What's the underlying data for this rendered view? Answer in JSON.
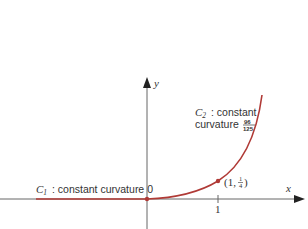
{
  "diagram": {
    "axes": {
      "x_label": "x",
      "y_label": "y",
      "x_tick_label": "1"
    },
    "curves": {
      "c1": {
        "name": "C",
        "subscript": "1",
        "description": ": constant curvature 0"
      },
      "c2": {
        "name": "C",
        "subscript": "2",
        "description_line1": ": constant",
        "description_line2": "curvature",
        "curvature_numerator": "96",
        "curvature_denominator": "125"
      }
    },
    "point": {
      "open": "(1, ",
      "numerator": "1",
      "denominator": "4",
      "close": ")"
    },
    "colors": {
      "curve": "#b03a36",
      "axis": "#555555",
      "text": "#333333"
    }
  }
}
